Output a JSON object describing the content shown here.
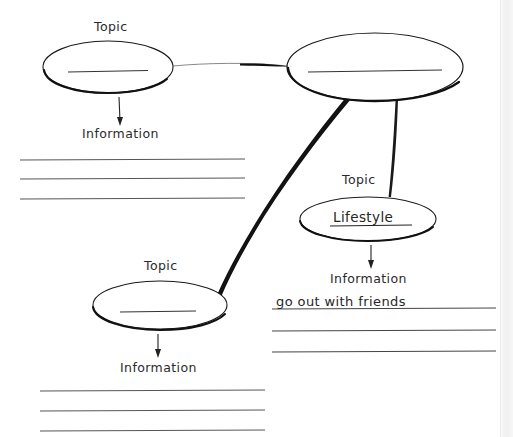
{
  "worksheet": {
    "type": "mind-map-graphic-organizer",
    "background_color": "#ffffff",
    "ink_color": "#1a1a1a",
    "page_edge_color": "#f0f0f0"
  },
  "nodes": [
    {
      "id": "topic-top-left",
      "topic_label": "Topic",
      "ellipse_value": "",
      "ellipse_has_blank_line": true,
      "info_label": "Information",
      "cx": 108,
      "cy": 67,
      "rx": 65,
      "ry": 26
    },
    {
      "id": "topic-center",
      "topic_label": "",
      "ellipse_value": "",
      "ellipse_has_blank_line": true,
      "info_label": "",
      "cx": 375,
      "cy": 67,
      "rx": 88,
      "ry": 34
    },
    {
      "id": "topic-lifestyle",
      "topic_label": "Topic",
      "ellipse_value": "Lifestyle",
      "ellipse_has_blank_line": false,
      "info_label": "Information",
      "cx": 368,
      "cy": 219,
      "rx": 68,
      "ry": 22
    },
    {
      "id": "topic-bottom-left",
      "topic_label": "Topic",
      "ellipse_value": "",
      "ellipse_has_blank_line": true,
      "info_label": "Information",
      "cx": 160,
      "cy": 305,
      "rx": 67,
      "ry": 24
    }
  ],
  "labels": {
    "topic_top_left": "Topic",
    "topic_lifestyle": "Topic",
    "topic_bottom_left": "Topic",
    "info_top_left": "Information",
    "info_lifestyle": "Information",
    "info_bottom_left": "Information",
    "lifestyle_value": "Lifestyle"
  },
  "writing_lines": {
    "upper_left": {
      "count": 3,
      "values": [
        "",
        "",
        ""
      ]
    },
    "right": {
      "count": 3,
      "values": [
        "go out with friends",
        "",
        ""
      ]
    },
    "bottom_left": {
      "count": 3,
      "values": [
        "",
        "",
        ""
      ]
    }
  },
  "connectors": [
    {
      "id": "top-left-to-center",
      "from": "topic-top-left",
      "to": "topic-center",
      "style": "tapered"
    },
    {
      "id": "center-to-bottom-left",
      "from": "topic-center",
      "to": "topic-bottom-left",
      "style": "tapered-thick"
    },
    {
      "id": "center-to-lifestyle",
      "from": "topic-center",
      "to": "topic-lifestyle",
      "style": "tapered"
    }
  ]
}
